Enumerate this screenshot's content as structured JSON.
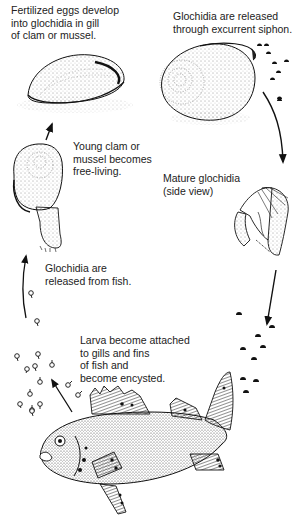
{
  "diagram": {
    "type": "life-cycle",
    "stages": [
      {
        "id": "eggs",
        "label": "Fertilized eggs develop\ninto glochidia in gill\nof clam or mussel."
      },
      {
        "id": "release",
        "label": "Glochidia are released\nthrough excurrent siphon."
      },
      {
        "id": "mature",
        "label": "Mature glochidia\n(side view)"
      },
      {
        "id": "attach",
        "label": "Larva become attached\nto gills and fins\nof fish and\nbecome encysted."
      },
      {
        "id": "fish-release",
        "label": "Glochidia are\nreleased from fish."
      },
      {
        "id": "young",
        "label": "Young clam or\nmussel becomes\nfree-living."
      }
    ],
    "colors": {
      "ink": "#1a1a1a",
      "background": "#ffffff"
    }
  }
}
